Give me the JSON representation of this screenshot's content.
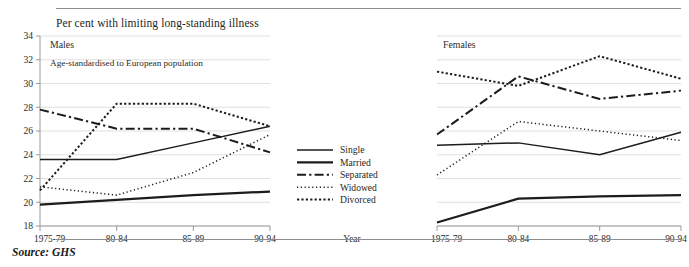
{
  "caption": "Per cent with limiting long-standing illness",
  "source": "Source: GHS",
  "note": "Age-standardised to European population",
  "axis_label_x": "Year",
  "panels": [
    {
      "title": "Males"
    },
    {
      "title": "Females"
    }
  ],
  "legend": {
    "items": [
      {
        "label": "Single",
        "style": "solid-thin"
      },
      {
        "label": "Married",
        "style": "solid-thick"
      },
      {
        "label": "Separated",
        "style": "dash-dot"
      },
      {
        "label": "Widowed",
        "style": "dotted-fine"
      },
      {
        "label": "Divorced",
        "style": "dotted-coarse"
      }
    ]
  },
  "chart_data": {
    "type": "line",
    "title": "Per cent with limiting long-standing illness",
    "subtitle": "Age-standardised to European population",
    "xlabel": "Year",
    "ylabel": "Per cent",
    "categories": [
      "1975-79",
      "80-84",
      "85-89",
      "90-94"
    ],
    "yticks": [
      18,
      20,
      22,
      24,
      26,
      28,
      30,
      32,
      34
    ],
    "ylim": [
      18,
      34
    ],
    "grid": true,
    "legend_position": "center",
    "annotation": "Source: GHS",
    "panels": [
      {
        "name": "Males",
        "series": [
          {
            "name": "Single",
            "style": "solid-thin",
            "values": [
              23.6,
              23.6,
              25.0,
              26.4
            ]
          },
          {
            "name": "Married",
            "style": "solid-thick",
            "values": [
              19.8,
              20.2,
              20.6,
              20.9
            ]
          },
          {
            "name": "Separated",
            "style": "dash-dot",
            "values": [
              27.8,
              26.2,
              26.2,
              24.2
            ]
          },
          {
            "name": "Widowed",
            "style": "dotted-fine",
            "values": [
              21.3,
              20.6,
              22.5,
              25.7
            ]
          },
          {
            "name": "Divorced",
            "style": "dotted-coarse",
            "values": [
              21.0,
              28.3,
              28.3,
              26.4
            ]
          }
        ]
      },
      {
        "name": "Females",
        "series": [
          {
            "name": "Single",
            "style": "solid-thin",
            "values": [
              24.8,
              25.0,
              24.0,
              25.9
            ]
          },
          {
            "name": "Married",
            "style": "solid-thick",
            "values": [
              18.3,
              20.3,
              20.5,
              20.6
            ]
          },
          {
            "name": "Separated",
            "style": "dash-dot",
            "values": [
              25.7,
              30.6,
              28.7,
              29.4
            ]
          },
          {
            "name": "Widowed",
            "style": "dotted-fine",
            "values": [
              22.3,
              26.8,
              26.0,
              25.2
            ]
          },
          {
            "name": "Divorced",
            "style": "dotted-coarse",
            "values": [
              31.0,
              29.8,
              32.3,
              30.4
            ]
          }
        ]
      }
    ]
  }
}
